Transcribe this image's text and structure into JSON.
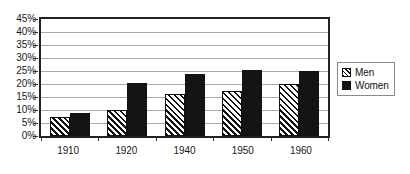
{
  "chart_data": {
    "type": "bar",
    "title": "",
    "subtitle": "",
    "xlabel": "",
    "ylabel": "",
    "categories": [
      "1910",
      "1920",
      "1940",
      "1950",
      "1960"
    ],
    "series": [
      {
        "name": "Men",
        "values": [
          7.5,
          10.0,
          16.0,
          17.5,
          20.0
        ]
      },
      {
        "name": "Women",
        "values": [
          9.0,
          20.5,
          24.0,
          25.5,
          25.0
        ]
      }
    ],
    "ylim": [
      0,
      45
    ],
    "ytick_step": 5,
    "ytick_labels": [
      "0%",
      "5%",
      "10%",
      "15%",
      "20%",
      "25%",
      "30%",
      "35%",
      "40%",
      "45%"
    ],
    "ytick_values": [
      0,
      5,
      10,
      15,
      20,
      25,
      30,
      35,
      40,
      45
    ],
    "grid": true,
    "grid_axis": "y",
    "legend_position": "right-outside",
    "value_suffix": "%"
  },
  "legend": {
    "items": [
      {
        "label": "Men",
        "swatch": "hatched-diagonal",
        "color": "#ffffff"
      },
      {
        "label": "Women",
        "swatch": "solid",
        "color": "#141414"
      }
    ]
  },
  "colors": {
    "axis": "#222222",
    "gridline": "#a9a9a9",
    "men_fill": "#ffffff",
    "men_hatch": "#111111",
    "women_fill": "#141414",
    "text": "#1a1a1a",
    "background": "#ffffff",
    "legend_border": "#8a8a8a"
  }
}
